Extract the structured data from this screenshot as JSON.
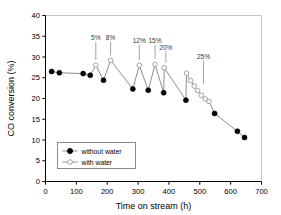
{
  "chart_data": {
    "type": "line",
    "title": "",
    "xlabel": "Time on stream (h)",
    "ylabel": "CO conversion (%)",
    "xlim": [
      0,
      700
    ],
    "ylim": [
      0,
      40
    ],
    "xticks": [
      0,
      100,
      200,
      300,
      400,
      500,
      600,
      700
    ],
    "yticks": [
      0,
      5,
      10,
      15,
      20,
      25,
      30,
      35,
      40
    ],
    "xtick_labels": [
      "0",
      "100",
      "200",
      "300",
      "400",
      "500",
      "600",
      "700"
    ],
    "ytick_labels": [
      "0",
      "5",
      "10",
      "15",
      "20",
      "25",
      "30",
      "35",
      "40"
    ],
    "grid": false,
    "legend_position": "lower left",
    "series": [
      {
        "name": "without water",
        "marker": "filled-circle",
        "color": "#000000",
        "points": [
          {
            "x": 20,
            "y": 26.5
          },
          {
            "x": 45,
            "y": 26.2
          },
          {
            "x": 122,
            "y": 26.0
          },
          {
            "x": 145,
            "y": 25.6
          },
          {
            "x": 188,
            "y": 24.4
          },
          {
            "x": 283,
            "y": 22.3
          },
          {
            "x": 333,
            "y": 22.0
          },
          {
            "x": 383,
            "y": 21.4
          },
          {
            "x": 455,
            "y": 19.6
          },
          {
            "x": 548,
            "y": 16.4
          },
          {
            "x": 622,
            "y": 12.1
          },
          {
            "x": 645,
            "y": 10.6
          }
        ]
      },
      {
        "name": "with water",
        "marker": "open-circle",
        "color": "#555555",
        "points": [
          {
            "x": 163,
            "y": 28.0
          },
          {
            "x": 211,
            "y": 29.2
          },
          {
            "x": 304,
            "y": 28.0
          },
          {
            "x": 355,
            "y": 28.2
          },
          {
            "x": 385,
            "y": 27.4
          },
          {
            "x": 457,
            "y": 26.1
          },
          {
            "x": 470,
            "y": 24.3
          },
          {
            "x": 482,
            "y": 23.0
          },
          {
            "x": 493,
            "y": 21.9
          },
          {
            "x": 505,
            "y": 20.8
          },
          {
            "x": 518,
            "y": 19.9
          },
          {
            "x": 530,
            "y": 19.3
          }
        ]
      }
    ],
    "path_order": [
      {
        "x": 20,
        "y": 26.5,
        "s": 0
      },
      {
        "x": 45,
        "y": 26.2,
        "s": 0
      },
      {
        "x": 122,
        "y": 26.0,
        "s": 0
      },
      {
        "x": 145,
        "y": 25.6,
        "s": 0
      },
      {
        "x": 163,
        "y": 28.0,
        "s": 1
      },
      {
        "x": 188,
        "y": 24.4,
        "s": 0
      },
      {
        "x": 211,
        "y": 29.2,
        "s": 1
      },
      {
        "x": 283,
        "y": 22.3,
        "s": 0
      },
      {
        "x": 304,
        "y": 28.0,
        "s": 1
      },
      {
        "x": 333,
        "y": 22.0,
        "s": 0
      },
      {
        "x": 355,
        "y": 28.2,
        "s": 1
      },
      {
        "x": 383,
        "y": 21.4,
        "s": 0
      },
      {
        "x": 385,
        "y": 27.4,
        "s": 1
      },
      {
        "x": 455,
        "y": 19.6,
        "s": 0
      },
      {
        "x": 457,
        "y": 26.1,
        "s": 1
      },
      {
        "x": 470,
        "y": 24.3,
        "s": 1
      },
      {
        "x": 482,
        "y": 23.0,
        "s": 1
      },
      {
        "x": 493,
        "y": 21.9,
        "s": 1
      },
      {
        "x": 505,
        "y": 20.8,
        "s": 1
      },
      {
        "x": 518,
        "y": 19.9,
        "s": 1
      },
      {
        "x": 530,
        "y": 19.3,
        "s": 1
      },
      {
        "x": 548,
        "y": 16.4,
        "s": 0
      },
      {
        "x": 622,
        "y": 12.1,
        "s": 0
      },
      {
        "x": 645,
        "y": 10.6,
        "s": 0
      }
    ],
    "annotations": [
      {
        "label": "5%",
        "x": 163,
        "label_y": 34.0,
        "tip_y": 29.3
      },
      {
        "label": "8%",
        "x": 211,
        "label_y": 34.0,
        "tip_y": 30.4
      },
      {
        "label": "12%",
        "x": 304,
        "label_y": 33.3,
        "tip_y": 29.2
      },
      {
        "label": "15%",
        "x": 355,
        "label_y": 33.3,
        "tip_y": 29.5
      },
      {
        "label": "20%",
        "x": 390,
        "label_y": 31.8,
        "tip_y": 28.6
      },
      {
        "label": "25%",
        "x": 512,
        "label_y": 29.6,
        "tip_y": 23.6
      }
    ],
    "legend": {
      "entries": [
        {
          "label": "without water",
          "marker": "filled-circle"
        },
        {
          "label": "with water",
          "marker": "open-circle"
        }
      ]
    },
    "colors": {
      "axis": "#000000",
      "line": "#808080",
      "marker_filled": "#000000",
      "marker_open_edge": "#9a9a9a",
      "annotation": "#3a3a3a",
      "background": "#ffffff"
    }
  }
}
